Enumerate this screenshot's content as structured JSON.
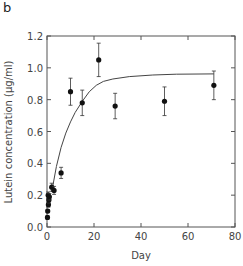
{
  "panel_label": "b",
  "chart_data": {
    "type": "scatter",
    "title": "",
    "xlabel": "Day",
    "ylabel": "Lutein concentration (µg/ml)",
    "xlim": [
      0,
      80
    ],
    "ylim": [
      0.0,
      1.2
    ],
    "xticks": [
      0,
      20,
      40,
      60,
      80
    ],
    "yticks": [
      0.0,
      0.2,
      0.4,
      0.6,
      0.8,
      1.0,
      1.2
    ],
    "xtick_labels": [
      "0",
      "20",
      "40",
      "60",
      "80"
    ],
    "ytick_labels": [
      "0.0",
      "0.2",
      "0.4",
      "0.6",
      "0.8",
      "1.0",
      "1.2"
    ],
    "grid": false,
    "legend": null,
    "series": [
      {
        "name": "measured",
        "marker": "filled-circle",
        "color": "#111111",
        "points": [
          {
            "x": 0.2,
            "y": 0.06,
            "err": 0.01
          },
          {
            "x": 0.3,
            "y": 0.1,
            "err": 0.01
          },
          {
            "x": 0.6,
            "y": 0.14,
            "err": 0.015
          },
          {
            "x": 0.8,
            "y": 0.17,
            "err": 0.02
          },
          {
            "x": 0.5,
            "y": 0.2,
            "err": 0.02
          },
          {
            "x": 1.0,
            "y": 0.19,
            "err": 0.02
          },
          {
            "x": 2.0,
            "y": 0.25,
            "err": 0.025
          },
          {
            "x": 3.0,
            "y": 0.23,
            "err": 0.025
          },
          {
            "x": 6.0,
            "y": 0.34,
            "err": 0.035
          },
          {
            "x": 10.0,
            "y": 0.85,
            "err": 0.085
          },
          {
            "x": 15.0,
            "y": 0.78,
            "err": 0.08
          },
          {
            "x": 22.0,
            "y": 1.05,
            "err": 0.105
          },
          {
            "x": 29.0,
            "y": 0.76,
            "err": 0.08
          },
          {
            "x": 50.0,
            "y": 0.79,
            "err": 0.09
          },
          {
            "x": 71.0,
            "y": 0.89,
            "err": 0.09
          }
        ]
      },
      {
        "name": "fit",
        "type": "line",
        "color": "#444444",
        "points": [
          {
            "x": 2,
            "y": 0.22
          },
          {
            "x": 4,
            "y": 0.38
          },
          {
            "x": 6,
            "y": 0.5
          },
          {
            "x": 8,
            "y": 0.59
          },
          {
            "x": 10,
            "y": 0.66
          },
          {
            "x": 12,
            "y": 0.72
          },
          {
            "x": 15,
            "y": 0.79
          },
          {
            "x": 18,
            "y": 0.85
          },
          {
            "x": 21,
            "y": 0.89
          },
          {
            "x": 24,
            "y": 0.915
          },
          {
            "x": 28,
            "y": 0.93
          },
          {
            "x": 35,
            "y": 0.945
          },
          {
            "x": 45,
            "y": 0.955
          },
          {
            "x": 55,
            "y": 0.96
          },
          {
            "x": 71,
            "y": 0.962
          }
        ]
      }
    ]
  }
}
